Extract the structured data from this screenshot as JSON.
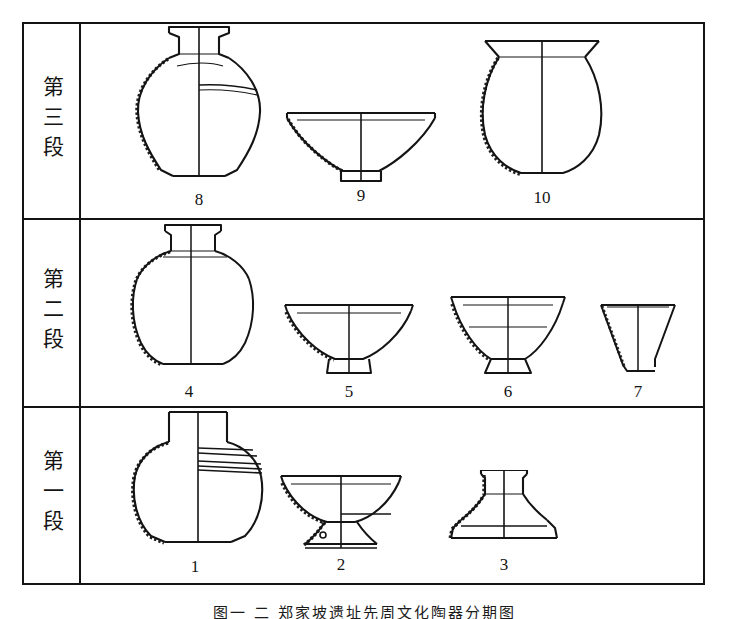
{
  "figure": {
    "caption": "图一  二  郑家坡遗址先周文化陶器分期图",
    "table_rows": [
      {
        "phase_label": "第三段",
        "vessels": [
          {
            "number": "8",
            "type": "high-shoulder-jar"
          },
          {
            "number": "9",
            "type": "shallow-bowl"
          },
          {
            "number": "10",
            "type": "round-bodied-pot"
          }
        ]
      },
      {
        "phase_label": "第二段",
        "vessels": [
          {
            "number": "4",
            "type": "high-shoulder-jar"
          },
          {
            "number": "5",
            "type": "ring-foot-bowl"
          },
          {
            "number": "6",
            "type": "deep-ring-foot-bowl"
          },
          {
            "number": "7",
            "type": "conical-cup"
          }
        ]
      },
      {
        "phase_label": "第一段",
        "vessels": [
          {
            "number": "1",
            "type": "banded-neck-jar"
          },
          {
            "number": "2",
            "type": "stemmed-bowl-dou"
          },
          {
            "number": "3",
            "type": "pedestal-stand"
          }
        ]
      }
    ]
  },
  "colors": {
    "ink": "#141414",
    "paper": "#ffffff"
  }
}
